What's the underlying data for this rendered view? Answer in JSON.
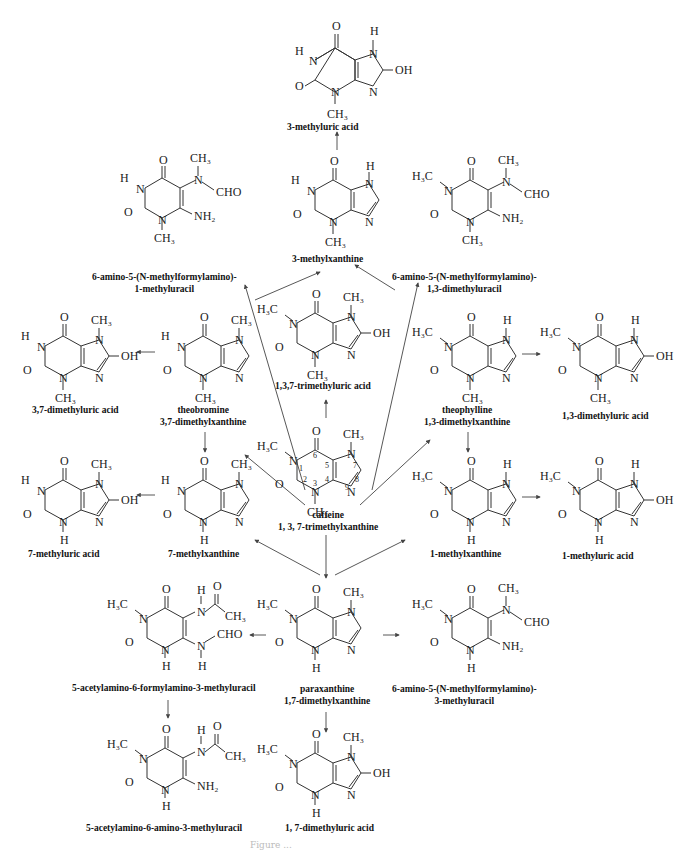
{
  "diagram": {
    "caption_partial": "Figure ...",
    "compounds": [
      {
        "id": "c1",
        "name": "3-methyluric acid"
      },
      {
        "id": "c2",
        "name": "6-amino-5-(N-methylformylamino)-",
        "name2": "1-methyluracil"
      },
      {
        "id": "c3",
        "name": "3-methylxanthine"
      },
      {
        "id": "c4",
        "name": "6-amino-5-(N-methylformylamino)-",
        "name2": "1,3-dimethyluracil"
      },
      {
        "id": "c5",
        "name": "3,7-dimethyluric acid"
      },
      {
        "id": "c6",
        "name": "theobromine",
        "name2": "3,7-dimethylxanthine"
      },
      {
        "id": "c7",
        "name": "1,3,7-trimethyluric acid"
      },
      {
        "id": "c8",
        "name": "theophylline",
        "name2": "1,3-dimethylxanthine"
      },
      {
        "id": "c9",
        "name": "1,3-dimethyluric acid"
      },
      {
        "id": "c10",
        "name": "caffeine",
        "name2": "1, 3, 7-trimethylxanthine"
      },
      {
        "id": "c11",
        "name": "7-methyluric acid"
      },
      {
        "id": "c12",
        "name": "7-methylxanthine"
      },
      {
        "id": "c13",
        "name": "1-methylxanthine"
      },
      {
        "id": "c14",
        "name": "1-methyluric acid"
      },
      {
        "id": "c15",
        "name": "5-acetylamino-6-formylamino-3-methyluracil"
      },
      {
        "id": "c16",
        "name": "paraxanthine",
        "name2": "1,7-dimethylxanthine"
      },
      {
        "id": "c17",
        "name": "6-amino-5-(N-methylformylamino)-",
        "name2": "3-methyluracil"
      },
      {
        "id": "c18",
        "name": "5-acetylamino-6-amino-3-methyluracil"
      },
      {
        "id": "c19",
        "name": "1, 7-dimethyluric acid"
      }
    ],
    "atoms": {
      "H": "H",
      "N": "N",
      "O": "O",
      "OH": "OH",
      "CH3": "CH₃",
      "H3C": "H₃C",
      "NH2": "NH₂",
      "CHO": "CHO",
      "pos1": "1",
      "pos2": "2",
      "pos3": "3",
      "pos4": "4",
      "pos5": "5",
      "pos6": "6",
      "pos7": "7",
      "pos8": "8",
      "pos9": "9"
    },
    "edges": [
      {
        "from": "caffeine",
        "to": "1,3,7-trimethyluric acid"
      },
      {
        "from": "caffeine",
        "to": "theobromine"
      },
      {
        "from": "caffeine",
        "to": "theophylline"
      },
      {
        "from": "caffeine",
        "to": "paraxanthine"
      },
      {
        "from": "caffeine",
        "to": "3-methylxanthine"
      },
      {
        "from": "caffeine",
        "to": "7-methylxanthine"
      },
      {
        "from": "caffeine",
        "to": "1-methylxanthine"
      },
      {
        "from": "3-methylxanthine",
        "to": "3-methyluric acid"
      },
      {
        "from": "theobromine",
        "to": "3,7-dimethyluric acid"
      },
      {
        "from": "theobromine",
        "to": "7-methylxanthine"
      },
      {
        "from": "theobromine",
        "to": "6-amino-5-(N-methylformylamino)-1-methyluracil"
      },
      {
        "from": "theophylline",
        "to": "1,3-dimethyluric acid"
      },
      {
        "from": "theophylline",
        "to": "1-methylxanthine"
      },
      {
        "from": "theophylline",
        "to": "6-amino-5-(N-methylformylamino)-1,3-dimethyluracil"
      },
      {
        "from": "7-methylxanthine",
        "to": "7-methyluric acid"
      },
      {
        "from": "1-methylxanthine",
        "to": "1-methyluric acid"
      },
      {
        "from": "paraxanthine",
        "to": "5-acetylamino-6-formylamino-3-methyluracil"
      },
      {
        "from": "paraxanthine",
        "to": "6-amino-5-(N-methylformylamino)-3-methyluracil"
      },
      {
        "from": "paraxanthine",
        "to": "1, 7-dimethyluric acid"
      },
      {
        "from": "5-acetylamino-6-formylamino-3-methyluracil",
        "to": "5-acetylamino-6-amino-3-methyluracil"
      }
    ]
  }
}
